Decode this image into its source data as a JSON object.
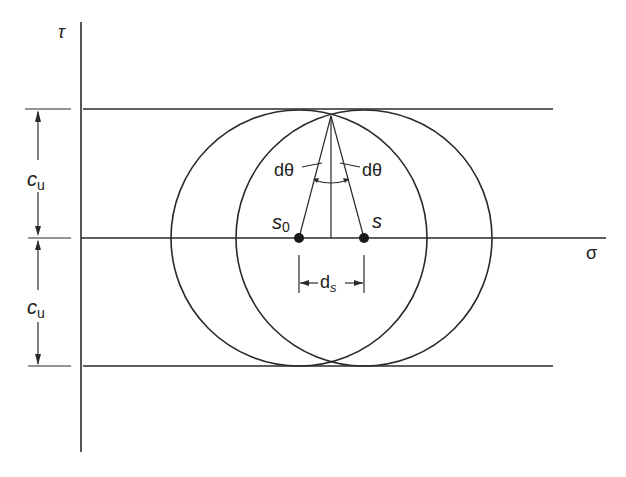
{
  "diagram": {
    "type": "mohr-circle",
    "axes": {
      "vertical_label": "τ",
      "horizontal_label": "σ"
    },
    "dimensions": {
      "upper_label_main": "c",
      "upper_label_sub": "u",
      "lower_label_main": "c",
      "lower_label_sub": "u",
      "ds_label_main": "d",
      "ds_label_sub": "s"
    },
    "angle_labels": {
      "left": "dθ",
      "right": "dθ"
    },
    "points": {
      "s0_main": "s",
      "s0_sub": "0",
      "s": "s"
    },
    "colors": {
      "line": "#2a2a2a",
      "background": "#ffffff"
    }
  }
}
